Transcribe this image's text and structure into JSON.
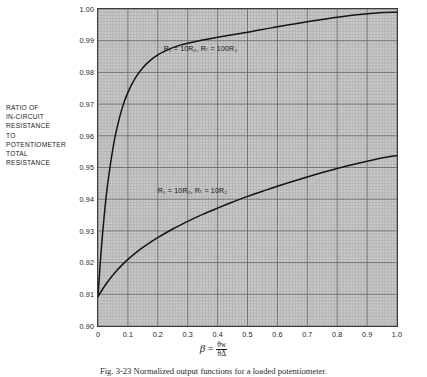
{
  "figure": {
    "caption": "Fig. 3-23  Normalized output functions for a loaded potentiometer."
  },
  "axis_label_block": {
    "lines": [
      "RATIO OF",
      "IN-CIRCUIT",
      "RESISTANCE",
      "TO",
      "POTENTIOMETER",
      "TOTAL",
      "RESISTANCE"
    ]
  },
  "xlabel": {
    "symbol": "β",
    "equals": "=",
    "numerator": "θw",
    "denominator": "θΔ"
  },
  "colors": {
    "plot_background": "#c9c9c9",
    "grid_minor": "#a8a8a8",
    "grid_major": "#6a6a6a",
    "frame": "#3b3b3b",
    "curve": "#141414",
    "text": "#1b1b1b"
  },
  "chart_data": {
    "type": "line",
    "title": "",
    "subtitle": "",
    "xlabel": "β = θw/θΔ",
    "ylabel": "RATIO OF IN-CIRCUIT RESISTANCE TO POTENTIOMETER TOTAL RESISTANCE",
    "xlim": [
      0,
      1.0
    ],
    "ylim": [
      0.9,
      1.0
    ],
    "xticks": [
      0,
      0.1,
      0.2,
      0.3,
      0.4,
      0.5,
      0.6,
      0.7,
      0.8,
      0.9,
      1.0
    ],
    "xticklabels": [
      "0",
      "0.1",
      "0.2",
      "0.3",
      "0.4",
      "0.5",
      "0.6",
      "0.7",
      "0.8",
      "0.9",
      "1.0"
    ],
    "yticks": [
      0.9,
      0.91,
      0.92,
      0.93,
      0.94,
      0.95,
      0.96,
      0.97,
      0.98,
      0.99,
      1.0
    ],
    "yticklabels": [
      "0.90",
      "0.91",
      "0.92",
      "0.93",
      "0.94",
      "0.95",
      "0.96",
      "0.97",
      "0.98",
      "0.99",
      "1.00"
    ],
    "grid": true,
    "grid_minor_divisions": 10,
    "legend_position": "inline-annotations",
    "series": [
      {
        "name": "R1 = 10R2, RT = 100R2",
        "annotation_text": "R₁ = 10R₂, Rₜ = 100R₂",
        "annotation_x": 0.22,
        "annotation_y": 0.9873,
        "x": [
          0.0,
          0.01,
          0.02,
          0.03,
          0.04,
          0.05,
          0.06,
          0.08,
          0.1,
          0.125,
          0.15,
          0.175,
          0.2,
          0.225,
          0.25,
          0.275,
          0.3,
          0.35,
          0.4,
          0.45,
          0.5,
          0.55,
          0.6,
          0.65,
          0.7,
          0.75,
          0.8,
          0.85,
          0.9,
          0.95,
          1.0
        ],
        "y": [
          0.9093,
          0.923,
          0.934,
          0.943,
          0.95,
          0.956,
          0.961,
          0.9685,
          0.9737,
          0.9783,
          0.9815,
          0.9838,
          0.9855,
          0.9868,
          0.9878,
          0.9886,
          0.9892,
          0.9902,
          0.9911,
          0.9919,
          0.9927,
          0.9935,
          0.9944,
          0.9952,
          0.996,
          0.9967,
          0.9974,
          0.998,
          0.9985,
          0.9989,
          0.999
        ]
      },
      {
        "name": "R1 = 10R2, RT = 10R2",
        "annotation_text": "R₁ = 10R₂, Rₜ = 10R₂",
        "annotation_x": 0.2,
        "annotation_y": 0.9425,
        "x": [
          0.0,
          0.02,
          0.04,
          0.06,
          0.08,
          0.1,
          0.125,
          0.15,
          0.175,
          0.2,
          0.25,
          0.3,
          0.35,
          0.4,
          0.45,
          0.5,
          0.55,
          0.6,
          0.65,
          0.7,
          0.75,
          0.8,
          0.85,
          0.9,
          0.95,
          1.0
        ],
        "y": [
          0.9093,
          0.9123,
          0.9149,
          0.9172,
          0.9192,
          0.921,
          0.923,
          0.9248,
          0.9264,
          0.9279,
          0.9306,
          0.933,
          0.9352,
          0.9372,
          0.9391,
          0.9409,
          0.9425,
          0.9441,
          0.9456,
          0.947,
          0.9484,
          0.9497,
          0.9509,
          0.952,
          0.953,
          0.9538
        ]
      }
    ]
  }
}
